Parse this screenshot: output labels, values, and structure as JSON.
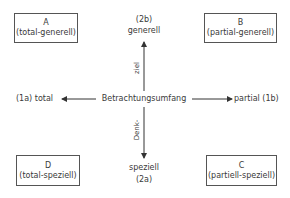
{
  "quadrants": {
    "A": {
      "letter": "A",
      "desc": "(total-generell)"
    },
    "B": {
      "letter": "B",
      "desc": "(partial-generell)"
    },
    "C": {
      "letter": "C",
      "desc": "(partiell-speziell)"
    },
    "D": {
      "letter": "D",
      "desc": "(total-speziell)"
    }
  },
  "axes": {
    "horizontal": {
      "label": "Betrachtungsumfang",
      "left_end": "(1a) total",
      "right_end": "partial (1b)"
    },
    "vertical": {
      "label_upper": "ziel",
      "label_lower": "Denk-",
      "top_end_code": "(2b)",
      "top_end": "generell",
      "bottom_end": "speziell",
      "bottom_end_code": "(2a)"
    }
  },
  "colors": {
    "line": "#333333",
    "text": "#3a3a3a",
    "background": "#ffffff"
  }
}
